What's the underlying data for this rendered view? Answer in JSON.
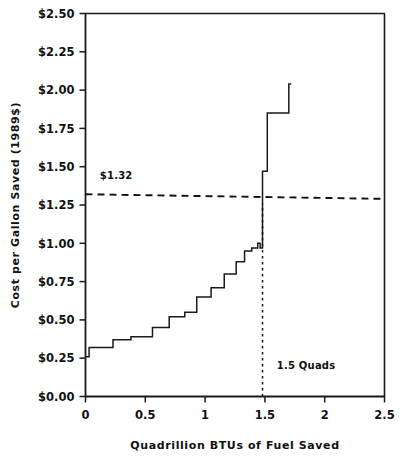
{
  "chart_data": {
    "type": "line",
    "subtype": "step",
    "title": "",
    "xlabel": "Quadrillion BTUs of Fuel Saved",
    "ylabel": "Cost per Gallon Saved (1989$)",
    "xlim": [
      0,
      2.5
    ],
    "ylim": [
      0,
      2.5
    ],
    "grid": false,
    "legend": "none",
    "xticks": [
      0,
      0.5,
      1,
      1.5,
      2,
      2.5
    ],
    "xtick_labels": [
      "0",
      "0.5",
      "1",
      "1.5",
      "2",
      "2.5"
    ],
    "yticks": [
      0,
      0.25,
      0.5,
      0.75,
      1,
      1.25,
      1.5,
      1.75,
      2,
      2.25,
      2.5
    ],
    "ytick_labels": [
      "$0.00",
      "$0.25",
      "$0.50",
      "$0.75",
      "$1.00",
      "$1.25",
      "$1.50",
      "$1.75",
      "$2.00",
      "$2.25",
      "$2.50"
    ],
    "series": [
      {
        "name": "Conservation supply curve",
        "style": "solid",
        "color": "#1a1a1a",
        "x": [
          0.0,
          0.03,
          0.03,
          0.23,
          0.23,
          0.38,
          0.38,
          0.56,
          0.56,
          0.7,
          0.7,
          0.83,
          0.83,
          0.93,
          0.93,
          1.05,
          1.05,
          1.16,
          1.16,
          1.26,
          1.26,
          1.33,
          1.33,
          1.39,
          1.39,
          1.44,
          1.44,
          1.46,
          1.46,
          1.48,
          1.48,
          1.52,
          1.52,
          1.7,
          1.7,
          1.72
        ],
        "y": [
          0.26,
          0.26,
          0.32,
          0.32,
          0.37,
          0.37,
          0.39,
          0.39,
          0.45,
          0.45,
          0.52,
          0.52,
          0.55,
          0.55,
          0.65,
          0.65,
          0.71,
          0.71,
          0.8,
          0.8,
          0.88,
          0.88,
          0.95,
          0.95,
          0.97,
          0.97,
          1.0,
          1.0,
          0.97,
          0.97,
          1.47,
          1.47,
          1.85,
          1.85,
          2.04,
          2.04
        ]
      },
      {
        "name": "Reference price line",
        "style": "dashed",
        "color": "#111111",
        "x": [
          0,
          2.5
        ],
        "y": [
          1.32,
          1.29
        ]
      },
      {
        "name": "1.5 Quads marker",
        "style": "dotted-vertical",
        "color": "#111111",
        "x": [
          1.48,
          1.48
        ],
        "y": [
          0.0,
          1.26
        ]
      }
    ],
    "annotations": [
      {
        "name": "price-line-label",
        "text": "$1.32",
        "x": 0.12,
        "y": 1.42
      },
      {
        "name": "quads-marker-label",
        "text": "1.5 Quads",
        "x": 1.6,
        "y": 0.18
      }
    ]
  },
  "axes": {
    "y_title": "Cost per Gallon Saved (1989$)",
    "x_title": "Quadrillion BTUs of Fuel Saved"
  },
  "tick_labels": {
    "y": [
      "$2.50",
      "$2.25",
      "$2.00",
      "$1.75",
      "$1.50",
      "$1.25",
      "$1.00",
      "$0.75",
      "$0.50",
      "$0.25",
      "$0.00"
    ],
    "x": [
      "0",
      "0.5",
      "1",
      "1.5",
      "2",
      "2.5"
    ]
  },
  "annotations": {
    "price": "$1.32",
    "quads": "1.5 Quads"
  },
  "colors": {
    "line": "#1a1a1a",
    "axis": "#1a1a1a",
    "background": "#ffffff",
    "text": "#111111"
  }
}
